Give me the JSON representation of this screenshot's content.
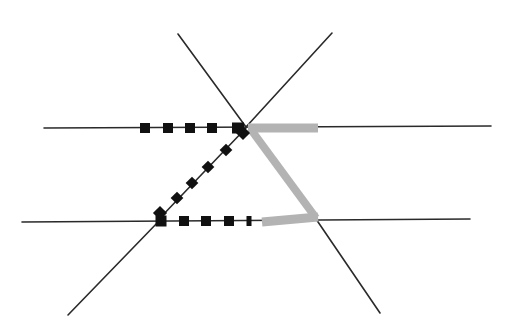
{
  "canvas": {
    "width": 510,
    "height": 336,
    "background": "#ffffff"
  },
  "colors": {
    "line": "#2a2a2a",
    "marker": "#111111",
    "gray_path": "#b3b3b3"
  },
  "lines": [
    {
      "name": "upper-horizontal-line",
      "x1": 44,
      "y1": 128,
      "x2": 491,
      "y2": 126
    },
    {
      "name": "lower-horizontal-line",
      "x1": 22,
      "y1": 222,
      "x2": 470,
      "y2": 219
    },
    {
      "name": "upper-left-diagonal-line",
      "x1": 178,
      "y1": 34,
      "x2": 246,
      "y2": 127
    },
    {
      "name": "upper-right-diagonal-line",
      "x1": 332,
      "y1": 33,
      "x2": 246,
      "y2": 127
    },
    {
      "name": "lower-left-diagonal-line",
      "x1": 160,
      "y1": 220,
      "x2": 68,
      "y2": 315
    },
    {
      "name": "lower-right-diagonal-line",
      "x1": 316,
      "y1": 219,
      "x2": 380,
      "y2": 313
    },
    {
      "name": "connecting-diagonal-line",
      "x1": 246,
      "y1": 128,
      "x2": 160,
      "y2": 218
    }
  ],
  "black_path": {
    "upper_squares": [
      {
        "x": 145,
        "y": 128,
        "w": 10,
        "h": 10
      },
      {
        "x": 168,
        "y": 128,
        "w": 10,
        "h": 10
      },
      {
        "x": 190,
        "y": 128,
        "w": 10,
        "h": 10
      },
      {
        "x": 212,
        "y": 128,
        "w": 10,
        "h": 10
      },
      {
        "x": 238,
        "y": 128,
        "w": 12,
        "h": 11
      }
    ],
    "diagonal_diamonds": [
      {
        "x": 243,
        "y": 133,
        "s": 10
      },
      {
        "x": 226,
        "y": 150,
        "s": 9
      },
      {
        "x": 208,
        "y": 167,
        "s": 9
      },
      {
        "x": 192,
        "y": 183,
        "s": 9
      },
      {
        "x": 177,
        "y": 198,
        "s": 9
      },
      {
        "x": 160,
        "y": 213,
        "s": 10
      }
    ],
    "lower_squares": [
      {
        "x": 161,
        "y": 221,
        "w": 11,
        "h": 11
      },
      {
        "x": 184,
        "y": 221,
        "w": 10,
        "h": 10
      },
      {
        "x": 206,
        "y": 221,
        "w": 10,
        "h": 10
      },
      {
        "x": 229,
        "y": 221,
        "w": 10,
        "h": 10
      },
      {
        "x": 249,
        "y": 221,
        "w": 5,
        "h": 10
      }
    ]
  },
  "gray_path": {
    "points": "248,128 318,128 M 252,131 L 316,218 M 262,222 L 318,217",
    "segments": [
      {
        "name": "gray-upper-segment",
        "x1": 248,
        "y1": 128,
        "x2": 318,
        "y2": 128,
        "width": 9
      },
      {
        "name": "gray-diagonal-segment",
        "x1": 252,
        "y1": 131,
        "x2": 316,
        "y2": 218,
        "width": 8
      },
      {
        "name": "gray-lower-segment",
        "x1": 262,
        "y1": 222,
        "x2": 318,
        "y2": 217,
        "width": 9
      }
    ]
  }
}
